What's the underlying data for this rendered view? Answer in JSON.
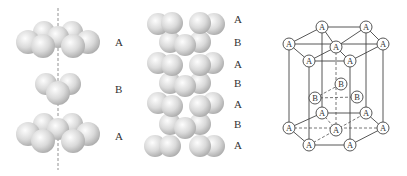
{
  "figure": {
    "panel_left": {
      "title": "exploded-layers",
      "layers": [
        {
          "label": "A",
          "y": 42
        },
        {
          "label": "B",
          "y": 89
        },
        {
          "label": "A",
          "y": 136
        }
      ]
    },
    "panel_middle": {
      "title": "stacked-layers",
      "layers": [
        {
          "label": "A",
          "y": 21
        },
        {
          "label": "B",
          "y": 42
        },
        {
          "label": "A",
          "y": 64
        },
        {
          "label": "B",
          "y": 82
        },
        {
          "label": "A",
          "y": 103
        },
        {
          "label": "B",
          "y": 124
        },
        {
          "label": "A",
          "y": 146
        }
      ]
    },
    "panel_right": {
      "title": "hcp-unit-cell",
      "top_atoms": [
        "A",
        "A",
        "A",
        "A",
        "A",
        "A",
        "A"
      ],
      "middle_atoms": [
        "B",
        "B",
        "B"
      ],
      "bottom_atoms": [
        "A",
        "A",
        "A",
        "A",
        "A",
        "A",
        "A"
      ]
    },
    "colors": {
      "sphere_light": "#fbfbfb",
      "sphere_mid": "#d6d6d6",
      "sphere_dark": "#a8a8a8",
      "line": "#444444",
      "text": "#333333"
    }
  }
}
